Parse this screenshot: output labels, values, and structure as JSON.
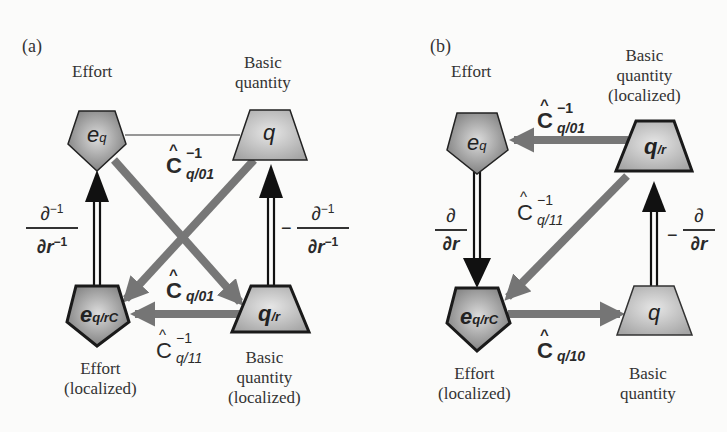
{
  "panels": [
    {
      "id": "a",
      "label": "(a)",
      "nodes": {
        "top_left": {
          "shape": "pentagon",
          "symbol": "e",
          "subscript": "q",
          "caption_lines": [
            "Effort"
          ]
        },
        "top_right": {
          "shape": "trapezoid",
          "symbol": "q",
          "subscript": "",
          "caption_lines": [
            "Basic",
            "quantity"
          ]
        },
        "bottom_left": {
          "shape": "pentagon",
          "symbol": "e",
          "subscript": "q/rC",
          "caption_lines": [
            "Effort",
            "(localized)"
          ]
        },
        "bottom_right": {
          "shape": "trapezoid",
          "symbol": "q",
          "subscript": "/r",
          "caption_lines": [
            "Basic",
            "quantity",
            "(localized)"
          ]
        }
      },
      "operators": {
        "top_edge": {
          "base": "C",
          "hat": "^",
          "sup": "−1",
          "sub": "q/01"
        },
        "cross": {
          "base": "C",
          "hat": "^",
          "sup": "",
          "sub": "q/01"
        },
        "bottom_edge": {
          "base": "C",
          "hat": "^",
          "sup": "−1",
          "sub": "q/11"
        },
        "left_vertical": {
          "sign": "",
          "num": "∂",
          "num_sup": "−1",
          "den": "∂r",
          "den_sup": "−1"
        },
        "right_vertical": {
          "sign": "−",
          "num": "∂",
          "num_sup": "−1",
          "den": "∂r",
          "den_sup": "−1"
        }
      }
    },
    {
      "id": "b",
      "label": "(b)",
      "nodes": {
        "top_left": {
          "shape": "pentagon",
          "symbol": "e",
          "subscript": "q",
          "caption_lines": [
            "Effort"
          ]
        },
        "top_right": {
          "shape": "trapezoid",
          "symbol": "q",
          "subscript": "/r",
          "caption_lines": [
            "Basic",
            "quantity",
            "(localized)"
          ]
        },
        "bottom_left": {
          "shape": "pentagon",
          "symbol": "e",
          "subscript": "q/rC",
          "caption_lines": [
            "Effort",
            "(localized)"
          ]
        },
        "bottom_right": {
          "shape": "trapezoid",
          "symbol": "q",
          "subscript": "",
          "caption_lines": [
            "Basic",
            "quantity"
          ]
        }
      },
      "operators": {
        "top_edge": {
          "base": "C",
          "hat": "^",
          "sup": "−1",
          "sub": "q/01"
        },
        "diagonal": {
          "base": "C",
          "hat": "^",
          "sup": "−1",
          "sub": "q/11"
        },
        "bottom_edge": {
          "base": "C",
          "hat": "^",
          "sup": "",
          "sub": "q/10"
        },
        "left_vertical": {
          "sign": "",
          "num": "∂",
          "num_sup": "",
          "den": "∂r",
          "den_sup": ""
        },
        "right_vertical": {
          "sign": "−",
          "num": "∂",
          "num_sup": "",
          "den": "∂r",
          "den_sup": ""
        }
      }
    }
  ],
  "colors": {
    "background": "#fbfbfa",
    "gray_arrow": "#7a7a7a",
    "black_arrow": "#111111",
    "pentagon_fill_center": "#d6d6d6",
    "pentagon_fill_edge": "#7d7d7d",
    "trapezoid_fill_center": "#e2e2e2",
    "trapezoid_fill_edge": "#a8a8a8",
    "outline": "#1c1c1c"
  }
}
